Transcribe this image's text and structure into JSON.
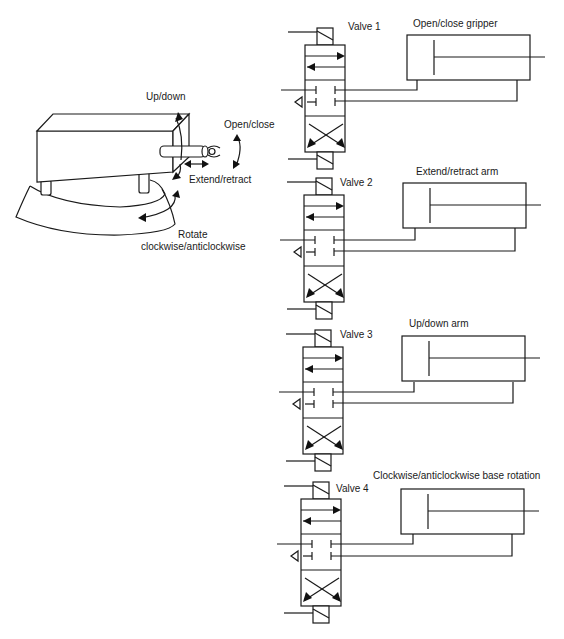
{
  "robot": {
    "labels": {
      "up_down": "Up/down",
      "open_close": "Open/close",
      "extend_retract": "Extend/retract",
      "rotate_line1": "Rotate",
      "rotate_line2": "clockwise/anticlockwise"
    }
  },
  "valves": [
    {
      "label": "Valve 1",
      "actuator": "Open/close gripper"
    },
    {
      "label": "Valve 2",
      "actuator": "Extend/retract arm"
    },
    {
      "label": "Valve 3",
      "actuator": "Up/down arm"
    },
    {
      "label": "Valve 4",
      "actuator": "Clockwise/anticlockwise base rotation"
    }
  ],
  "colors": {
    "line": "#1a1a1a",
    "background": "#ffffff"
  }
}
